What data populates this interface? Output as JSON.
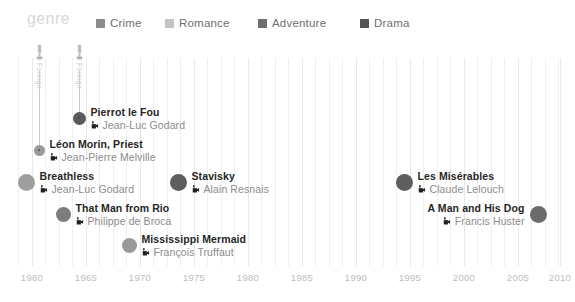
{
  "header": {
    "genre_label": "genre",
    "legend": [
      {
        "label": "Crime",
        "color": "#8c8c8c",
        "x": 96
      },
      {
        "label": "Romance",
        "color": "#c4c4c4",
        "x": 165
      },
      {
        "label": "Adventure",
        "color": "#6e6e6e",
        "x": 258
      },
      {
        "label": "Drama",
        "color": "#555555",
        "x": 360
      }
    ]
  },
  "axis": {
    "ticks": [
      "1960",
      "1965",
      "1970",
      "1975",
      "1980",
      "1985",
      "1990",
      "1995",
      "2000",
      "2005",
      "2010"
    ],
    "tick_x": [
      32,
      86,
      140,
      194,
      248,
      302,
      356,
      410,
      464,
      518,
      560
    ],
    "minor_x": [
      18,
      45,
      59,
      72,
      99,
      113,
      126,
      153,
      167,
      180,
      207,
      221,
      234,
      261,
      275,
      288,
      315,
      329,
      342,
      369,
      383,
      396,
      423,
      437,
      450,
      477,
      491,
      504,
      531,
      545,
      558
    ]
  },
  "chart_data": {
    "type": "scatter",
    "title": "genre",
    "xlabel": "",
    "ylabel": "",
    "xlim": [
      1958,
      2011
    ],
    "grid": true,
    "legend_position": "top",
    "camera_icon": "movie-camera-icon",
    "award_icon": "oscar-statuette-icon",
    "points": [
      {
        "title": "Pierrot le Fou",
        "director": "Jean-Luc Godard",
        "year": 1965,
        "genre": "Crime",
        "color": "#5a5a5a",
        "size": 13,
        "cx": 79,
        "cy": 118,
        "label_side": "right",
        "award": "Foreign",
        "award_y": 44
      },
      {
        "title": "Léon Morin, Priest",
        "director": "Jean-Pierre Melville",
        "year": 1961,
        "genre": "Drama",
        "color": "#9a9a9a",
        "size": 11,
        "cx": 39,
        "cy": 150,
        "label_side": "right",
        "award": "Foreign",
        "award_y": 44
      },
      {
        "title": "Breathless",
        "director": "Jean-Luc Godard",
        "year": 1960,
        "genre": "Crime",
        "color": "#9e9e9e",
        "size": 17,
        "cx": 26,
        "cy": 182,
        "label_side": "right",
        "award": null,
        "award_y": null
      },
      {
        "title": "Stavisky",
        "director": "Alain Resnais",
        "year": 1974,
        "genre": "Drama",
        "color": "#5e5e5e",
        "size": 17,
        "cx": 178,
        "cy": 182,
        "label_side": "right",
        "award": null,
        "award_y": null
      },
      {
        "title": "Les Misérables",
        "director": "Claude Lelouch",
        "year": 1995,
        "genre": "Drama",
        "color": "#5e5e5e",
        "size": 17,
        "cx": 404,
        "cy": 182,
        "label_side": "right",
        "award": null,
        "award_y": null
      },
      {
        "title": "That Man from Rio",
        "director": "Philippe de Broca",
        "year": 1964,
        "genre": "Adventure",
        "color": "#7d7d7d",
        "size": 15,
        "cx": 63,
        "cy": 214,
        "label_side": "right",
        "award": null,
        "award_y": null
      },
      {
        "title": "A Man and His Dog",
        "director": "Francis Huster",
        "year": 2008,
        "genre": "Drama",
        "color": "#6b6b6b",
        "size": 17,
        "cx": 538,
        "cy": 214,
        "label_side": "left",
        "award": null,
        "award_y": null
      },
      {
        "title": "Mississippi Mermaid",
        "director": "François Truffaut",
        "year": 1969,
        "genre": "Romance",
        "color": "#9a9a9a",
        "size": 15,
        "cx": 129,
        "cy": 245,
        "label_side": "right",
        "award": null,
        "award_y": null
      }
    ]
  }
}
